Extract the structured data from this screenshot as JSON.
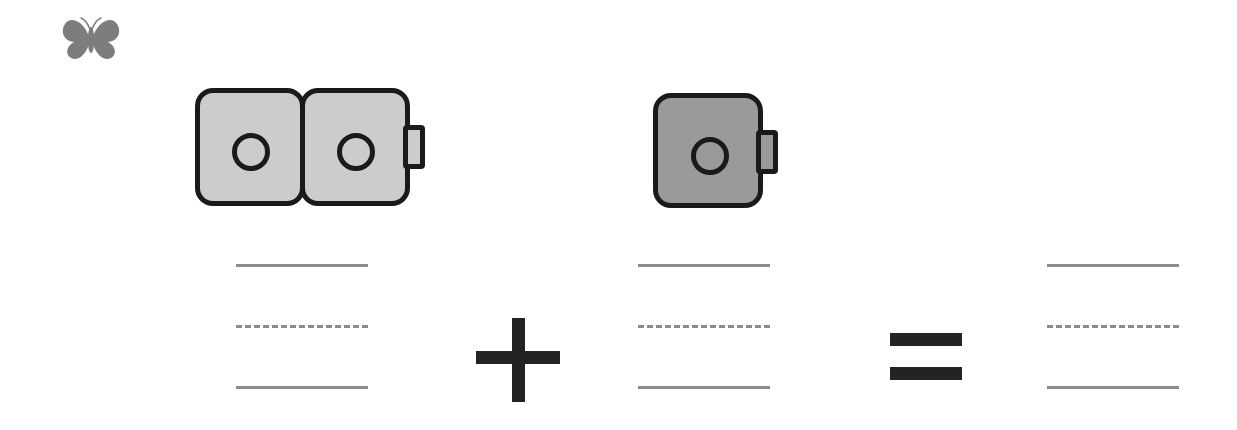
{
  "worksheet": {
    "title": "Cube Addition Worksheet",
    "background_color": "#ffffff"
  },
  "mascot": {
    "icon": "butterfly-icon",
    "label": "Butterfly",
    "color": "#7a7a7a"
  },
  "equation": {
    "expression": "2 + 1 = ___",
    "operator_plus": "+",
    "operator_equals": "=",
    "operands": [
      {
        "name": "addend-1",
        "cube_count": 2,
        "value": 2,
        "fill_color": "#cccccc",
        "outline_color": "#1a1a1a",
        "has_connector_tab": true
      },
      {
        "name": "addend-2",
        "cube_count": 1,
        "value": 1,
        "fill_color": "#9a9a9a",
        "outline_color": "#1a1a1a",
        "has_connector_tab": true
      }
    ],
    "answer": {
      "name": "sum",
      "value": "",
      "placeholder": ""
    }
  },
  "writing_lines": {
    "line_color": "#8c8c8c",
    "top_style": "solid",
    "middle_style": "dashed",
    "bottom_style": "solid",
    "groups": [
      {
        "name": "lines-addend1",
        "value": ""
      },
      {
        "name": "lines-addend2",
        "value": ""
      },
      {
        "name": "lines-sum",
        "value": ""
      }
    ]
  }
}
